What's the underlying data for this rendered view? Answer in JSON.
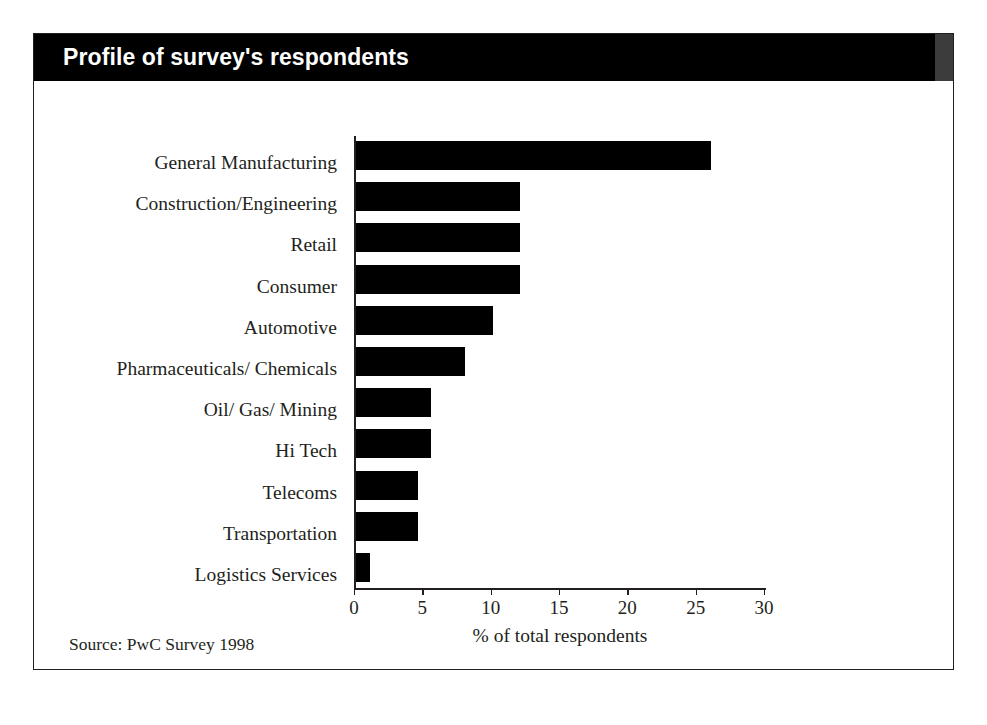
{
  "figure": {
    "title": "Profile of survey's respondents",
    "source": "Source: PwC Survey 1998"
  },
  "chart_data": {
    "type": "bar",
    "orientation": "horizontal",
    "title": "Profile of survey's respondents",
    "xlabel": "% of total respondents",
    "ylabel": "",
    "xlim": [
      0,
      30
    ],
    "xticks": [
      "0",
      "5",
      "10",
      "15",
      "20",
      "25",
      "30"
    ],
    "xtick_values": [
      0,
      5,
      10,
      15,
      20,
      25,
      30
    ],
    "grid": false,
    "legend": null,
    "bar_color": "#000000",
    "categories": [
      "General Manufacturing",
      "Construction/Engineering",
      "Retail",
      "Consumer",
      "Automotive",
      "Pharmaceuticals/ Chemicals",
      "Oil/ Gas/ Mining",
      "Hi Tech",
      "Telecoms",
      "Transportation",
      "Logistics Services"
    ],
    "values": [
      26,
      12,
      12,
      12,
      10,
      8,
      5.5,
      5.5,
      4.5,
      4.5,
      1
    ],
    "source": "Source: PwC Survey 1998"
  }
}
